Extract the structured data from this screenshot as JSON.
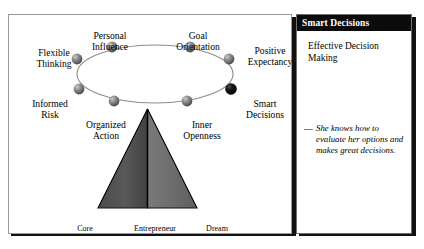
{
  "diagram": {
    "nodes": [
      {
        "id": "flexible-thinking",
        "label": "Flexible\nThinking",
        "highlighted": false
      },
      {
        "id": "personal-influence",
        "label": "Personal\nInfluence",
        "highlighted": false
      },
      {
        "id": "goal-orientation",
        "label": "Goal\nOrientation",
        "highlighted": false
      },
      {
        "id": "positive-expectancy",
        "label": "Positive\nExpectancy",
        "highlighted": false
      },
      {
        "id": "smart-decisions",
        "label": "Smart\nDecisions",
        "highlighted": true
      },
      {
        "id": "inner-openness",
        "label": "Inner\nOpenness",
        "highlighted": false
      },
      {
        "id": "organized-action",
        "label": "Organized\nAction",
        "highlighted": false
      },
      {
        "id": "informed-risk",
        "label": "Informed\nRisk",
        "highlighted": false
      }
    ],
    "pyramid": {
      "base_labels": [
        "Core",
        "Entrepreneur",
        "Dream"
      ],
      "left_fill": "#555555",
      "right_fill": "#6b6b6b"
    },
    "colors": {
      "node_default": "#6e6e6e",
      "node_highlight": "#0a0a0a",
      "ellipse_stroke": "#8d8d8d"
    }
  },
  "panel": {
    "header": "Smart Decisions",
    "title": "Effective Decision Making",
    "quote_dash": "—",
    "quote": "She knows how to evaluate her options and makes great decisions.",
    "header_bg": "#0b0b0b",
    "header_fg": "#ffffff"
  }
}
